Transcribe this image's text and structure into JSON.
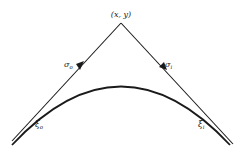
{
  "diagram": {
    "type": "geometric-ray-diagram",
    "apex": {
      "label": "(x, y)",
      "pos": [
        121,
        23
      ]
    },
    "curve": {
      "description": "convex arc (boundary)",
      "start": [
        12,
        145
      ],
      "peak": [
        121,
        86
      ],
      "end": [
        230,
        145
      ]
    },
    "rays": [
      {
        "name": "incoming",
        "from": [
          38,
          113
        ],
        "to": [
          121,
          23
        ],
        "direction_label": {
          "base": "σ",
          "sub": "o"
        },
        "arrow_dir": "toward-apex"
      },
      {
        "name": "outgoing",
        "from": [
          121,
          23
        ],
        "to": [
          207,
          113
        ],
        "direction_label": {
          "base": "σ",
          "sub": "i"
        },
        "arrow_dir": "away-from-apex"
      }
    ],
    "points": [
      {
        "label_base": "ξ",
        "label_sub": "o",
        "pos": [
          38,
          113
        ]
      },
      {
        "label_base": "ξ",
        "label_sub": "i",
        "pos": [
          207,
          113
        ]
      }
    ],
    "colors": {
      "ink": "#1a1a1a",
      "background": "#ffffff"
    }
  }
}
